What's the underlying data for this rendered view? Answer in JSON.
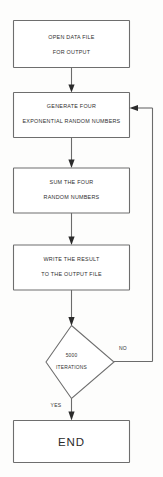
{
  "diagram": {
    "type": "flowchart",
    "nodes": [
      {
        "id": "open-data-file",
        "shape": "process",
        "line1": "OPEN DATA FILE",
        "line2": "FOR OUTPUT"
      },
      {
        "id": "generate-four",
        "shape": "process",
        "line1": "GENERATE FOUR",
        "line2": "EXPONENTIAL RANDOM NUMBERS"
      },
      {
        "id": "sum-the-four",
        "shape": "process",
        "line1": "SUM THE FOUR",
        "line2": "RANDOM NUMBERS"
      },
      {
        "id": "write-the-result",
        "shape": "process",
        "line1": "WRITE THE RESULT",
        "line2": "TO THE OUTPUT FILE"
      },
      {
        "id": "iterations-decision",
        "shape": "decision",
        "line1": "5000",
        "line2": "ITERATIONS"
      },
      {
        "id": "end",
        "shape": "terminator",
        "line1": "END"
      }
    ],
    "edge_labels": {
      "no": "NO",
      "yes": "YES"
    },
    "colors": {
      "background": "#fdfdfc",
      "node_fill": "#ffffff",
      "node_stroke": "#6e6e6e",
      "connector": "#6b6b6b",
      "arrow": "#2b2b2b",
      "text": "#2f2f2f"
    }
  }
}
